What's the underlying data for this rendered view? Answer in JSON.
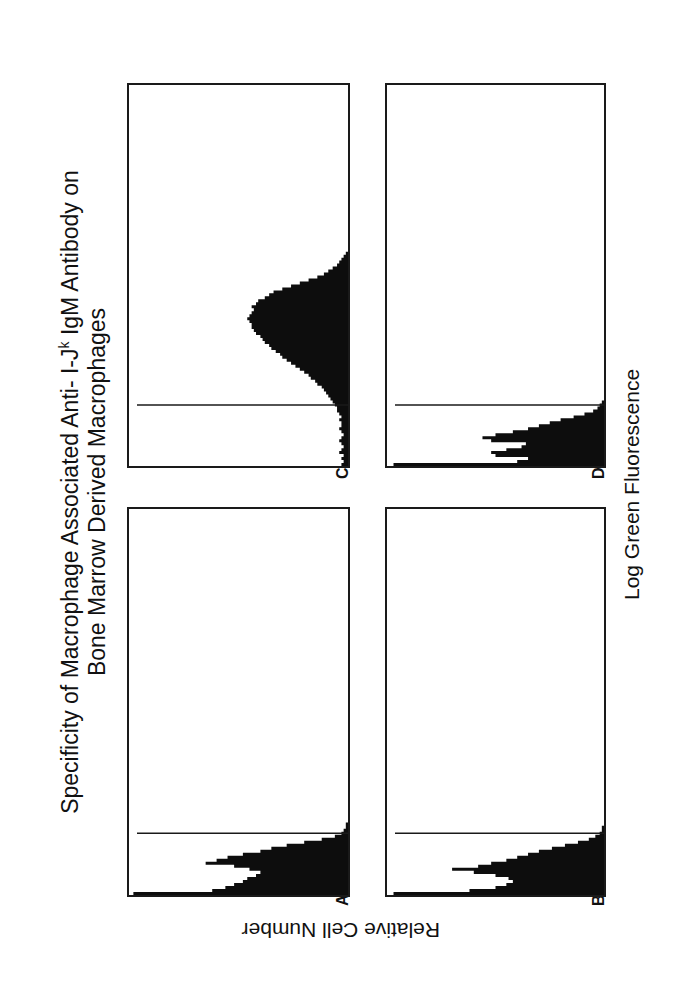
{
  "figure": {
    "title_line1_prefix": "Specificity of Macrophage Associated Anti- I-J",
    "title_line1_sup": "k",
    "title_line1_suffix": " IgM Antibody on",
    "title_line2": "Bone Marrow Derived Macrophages",
    "xlabel": "Log Green Fluorescence",
    "ylabel": "Relative Cell Number"
  },
  "chart_data": {
    "type": "bar",
    "xlabel": "Log Green Fluorescence",
    "ylabel": "Relative Cell Number",
    "orientation_note": "figure rendered rotated 90 degrees counter-clockwise",
    "bins": 128,
    "value_units": "percent of panel height",
    "grid": false,
    "panels": [
      {
        "label": "A",
        "marker_bin": 20,
        "values": [
          98,
          62,
          56,
          52,
          48,
          46,
          42,
          40,
          45,
          52,
          65,
          60,
          55,
          48,
          40,
          35,
          28,
          20,
          12,
          6,
          3,
          2,
          1,
          1
        ]
      },
      {
        "label": "B",
        "marker_bin": 20,
        "values": [
          97,
          62,
          50,
          45,
          42,
          44,
          50,
          60,
          70,
          58,
          52,
          45,
          40,
          35,
          30,
          24,
          18,
          12,
          7,
          4,
          2,
          1,
          1
        ]
      },
      {
        "label": "C",
        "marker_bin": 20,
        "values": [
          3,
          2,
          3,
          2,
          4,
          3,
          2,
          3,
          4,
          3,
          2,
          3,
          4,
          3,
          3,
          4,
          3,
          4,
          5,
          5,
          6,
          7,
          8,
          9,
          10,
          11,
          12,
          14,
          15,
          17,
          18,
          20,
          22,
          24,
          26,
          28,
          30,
          31,
          33,
          35,
          36,
          38,
          39,
          40,
          42,
          43,
          44,
          44,
          45,
          46,
          45,
          44,
          43,
          44,
          42,
          41,
          38,
          36,
          34,
          30,
          26,
          22,
          18,
          14,
          11,
          9,
          7,
          5,
          4,
          3,
          2,
          1
        ]
      },
      {
        "label": "D",
        "marker_bin": 20,
        "values": [
          97,
          40,
          35,
          50,
          52,
          45,
          38,
          36,
          52,
          56,
          50,
          42,
          35,
          30,
          25,
          20,
          14,
          9,
          5,
          3,
          2,
          1
        ]
      }
    ]
  }
}
